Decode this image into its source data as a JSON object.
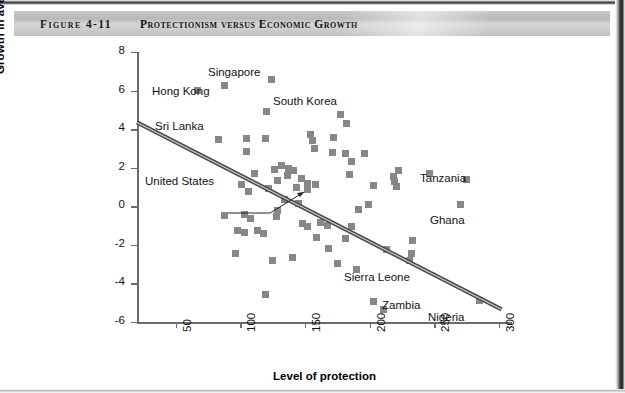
{
  "figure": {
    "number": "Figure 4-11",
    "title": "Protectionism versus Economic Growth"
  },
  "chart_data": {
    "type": "scatter",
    "title": "Protectionism versus Economic Growth",
    "xlabel": "Level of protection",
    "ylabel": "Growth in average yearly income per capita (%)",
    "xlim": [
      20,
      310
    ],
    "ylim": [
      -6,
      8
    ],
    "xticks": [
      50,
      100,
      150,
      200,
      250,
      300
    ],
    "yticks": [
      8,
      6,
      4,
      2,
      0,
      -2,
      -4,
      -6
    ],
    "grid": false,
    "legend": null,
    "marker": {
      "shape": "square",
      "color": "#878787",
      "size_px": 7
    },
    "trendline": {
      "label": "fitted regression line",
      "color": "#4a4a4a",
      "style": "double-stroke",
      "x_start": 20,
      "y_start": 4.35,
      "x_end": 302,
      "y_end": -5.35
    },
    "points": [
      {
        "x": 67,
        "y": 6.0,
        "label": "Hong Kong"
      },
      {
        "x": 88,
        "y": 6.25,
        "label": "Singapore"
      },
      {
        "x": 124,
        "y": 6.6,
        "label": null
      },
      {
        "x": 120,
        "y": 4.9,
        "label": "South Korea"
      },
      {
        "x": 177,
        "y": 4.75,
        "label": null
      },
      {
        "x": 182,
        "y": 4.3,
        "label": null
      },
      {
        "x": 83,
        "y": 3.45,
        "label": "Sri Lanka"
      },
      {
        "x": 105,
        "y": 3.5,
        "label": null
      },
      {
        "x": 119,
        "y": 3.5,
        "label": null
      },
      {
        "x": 156,
        "y": 3.4,
        "label": null
      },
      {
        "x": 157,
        "y": 3.0,
        "label": null
      },
      {
        "x": 154,
        "y": 3.7,
        "label": null
      },
      {
        "x": 105,
        "y": 2.85,
        "label": null
      },
      {
        "x": 172,
        "y": 3.55,
        "label": null
      },
      {
        "x": 171,
        "y": 2.8,
        "label": null
      },
      {
        "x": 181,
        "y": 2.75,
        "label": null
      },
      {
        "x": 196,
        "y": 2.75,
        "label": null
      },
      {
        "x": 186,
        "y": 2.3,
        "label": null
      },
      {
        "x": 222,
        "y": 1.85,
        "label": null
      },
      {
        "x": 218,
        "y": 1.55,
        "label": null
      },
      {
        "x": 219,
        "y": 1.3,
        "label": null
      },
      {
        "x": 184,
        "y": 1.65,
        "label": null
      },
      {
        "x": 246,
        "y": 1.7,
        "label": null
      },
      {
        "x": 275,
        "y": 1.4,
        "label": "Tanzania"
      },
      {
        "x": 111,
        "y": 1.7,
        "label": null
      },
      {
        "x": 126,
        "y": 1.9,
        "label": null
      },
      {
        "x": 132,
        "y": 2.1,
        "label": null
      },
      {
        "x": 137,
        "y": 1.95,
        "label": null
      },
      {
        "x": 141,
        "y": 1.85,
        "label": null
      },
      {
        "x": 136,
        "y": 1.6,
        "label": null
      },
      {
        "x": 129,
        "y": 1.35,
        "label": "United States"
      },
      {
        "x": 147,
        "y": 1.45,
        "label": null
      },
      {
        "x": 152,
        "y": 1.2,
        "label": null
      },
      {
        "x": 158,
        "y": 1.15,
        "label": null
      },
      {
        "x": 143,
        "y": 1.0,
        "label": null
      },
      {
        "x": 152,
        "y": 0.85,
        "label": null
      },
      {
        "x": 101,
        "y": 1.15,
        "label": null
      },
      {
        "x": 106,
        "y": 0.75,
        "label": null
      },
      {
        "x": 122,
        "y": 0.9,
        "label": null
      },
      {
        "x": 203,
        "y": 1.1,
        "label": null
      },
      {
        "x": 221,
        "y": 1.05,
        "label": null
      },
      {
        "x": 270,
        "y": 0.1,
        "label": "Ghana"
      },
      {
        "x": 134,
        "y": 0.35,
        "label": null
      },
      {
        "x": 145,
        "y": 0.15,
        "label": null
      },
      {
        "x": -1,
        "y": 0,
        "label": null
      },
      {
        "x": 129,
        "y": -0.2,
        "label": null
      },
      {
        "x": 191,
        "y": -0.15,
        "label": null
      },
      {
        "x": 199,
        "y": 0.1,
        "label": null
      },
      {
        "x": 88,
        "y": -0.5,
        "label": null
      },
      {
        "x": 103,
        "y": -0.4,
        "label": null
      },
      {
        "x": 108,
        "y": -0.65,
        "label": null
      },
      {
        "x": 128,
        "y": -0.55,
        "label": null
      },
      {
        "x": 148,
        "y": -0.9,
        "label": null
      },
      {
        "x": 152,
        "y": -1.05,
        "label": null
      },
      {
        "x": 162,
        "y": -0.85,
        "label": null
      },
      {
        "x": 167,
        "y": -1.0,
        "label": null
      },
      {
        "x": 186,
        "y": -1.05,
        "label": null
      },
      {
        "x": 98,
        "y": -1.25,
        "label": null
      },
      {
        "x": 103,
        "y": -1.35,
        "label": null
      },
      {
        "x": 113,
        "y": -1.25,
        "label": null
      },
      {
        "x": 118,
        "y": -1.4,
        "label": null
      },
      {
        "x": 159,
        "y": -1.6,
        "label": null
      },
      {
        "x": 181,
        "y": -1.65,
        "label": null
      },
      {
        "x": 233,
        "y": -1.75,
        "label": null
      },
      {
        "x": 96,
        "y": -2.45,
        "label": null
      },
      {
        "x": 125,
        "y": -2.8,
        "label": null
      },
      {
        "x": 140,
        "y": -2.65,
        "label": null
      },
      {
        "x": 168,
        "y": -2.2,
        "label": null
      },
      {
        "x": 213,
        "y": -2.25,
        "label": null
      },
      {
        "x": 232,
        "y": -2.45,
        "label": "Sierra Leone"
      },
      {
        "x": 231,
        "y": -2.8,
        "label": null
      },
      {
        "x": 175,
        "y": -2.95,
        "label": null
      },
      {
        "x": 190,
        "y": -3.3,
        "label": null
      },
      {
        "x": 119,
        "y": -4.55,
        "label": null
      },
      {
        "x": 203,
        "y": -4.95,
        "label": "Zambia"
      },
      {
        "x": 211,
        "y": -5.35,
        "label": null
      },
      {
        "x": 285,
        "y": -4.9,
        "label": "Nigeria"
      }
    ],
    "annotations": [
      {
        "text": "Singapore",
        "x_px": 208,
        "y_px": 66,
        "leader": false
      },
      {
        "text": "Hong Kong",
        "x_px": 152,
        "y_px": 85,
        "leader": false
      },
      {
        "text": "South Korea",
        "x_px": 273,
        "y_px": 95,
        "leader": false
      },
      {
        "text": "Sri Lanka",
        "x_px": 155,
        "y_px": 120,
        "leader": false
      },
      {
        "text": "United States",
        "x_px": 145,
        "y_px": 175,
        "leader": true
      },
      {
        "text": "Tanzania",
        "x_px": 420,
        "y_px": 172,
        "leader": false
      },
      {
        "text": "Ghana",
        "x_px": 430,
        "y_px": 214,
        "leader": false
      },
      {
        "text": "Sierra Leone",
        "x_px": 344,
        "y_px": 271,
        "leader": false
      },
      {
        "text": "Zambia",
        "x_px": 382,
        "y_px": 299,
        "leader": false
      },
      {
        "text": "Nigeria",
        "x_px": 428,
        "y_px": 311,
        "leader": false
      }
    ]
  }
}
